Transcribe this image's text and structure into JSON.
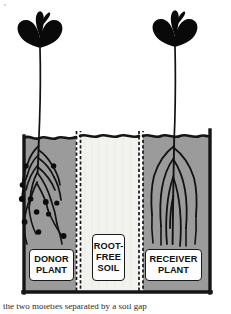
{
  "figure": {
    "type": "scientific-illustration",
    "width": 231,
    "height": 314
  },
  "colors": {
    "soil_fill": "#9b9b9b",
    "root_free_soil_fill": "#f2f2ee",
    "ink": "#111111",
    "wall": "#1a1a1a",
    "label_background": "#fdfdfd",
    "page_background": "#ffffff"
  },
  "compartments": [
    {
      "id": "donor",
      "label_lines": [
        "DONOR",
        "PLANT"
      ],
      "soil": "shaded-soil",
      "has_plant": true,
      "root_nodules": 11
    },
    {
      "id": "root-free",
      "label_lines": [
        "ROOT-",
        "FREE",
        "SOIL"
      ],
      "soil": "light-soil",
      "has_plant": false,
      "root_nodules": 0
    },
    {
      "id": "receiver",
      "label_lines": [
        "RECEIVER",
        "PLANT"
      ],
      "soil": "shaded-soil",
      "has_plant": true,
      "root_nodules": 0
    }
  ],
  "labels": {
    "donor": {
      "line1": "DONOR",
      "line2": "PLANT"
    },
    "root_free": {
      "line1": "ROOT-",
      "line2": "FREE",
      "line3": "SOIL"
    },
    "receiver": {
      "line1": "RECEIVER",
      "line2": "PLANT"
    }
  },
  "caption": {
    "cropped_text": "the two moieties separated by a soil gap"
  },
  "icons": {
    "seedling_left": "seedling-icon",
    "seedling_right": "seedling-icon",
    "divider_left": "mesh-divider-icon",
    "divider_right": "mesh-divider-icon",
    "nodule": "root-nodule-icon"
  }
}
